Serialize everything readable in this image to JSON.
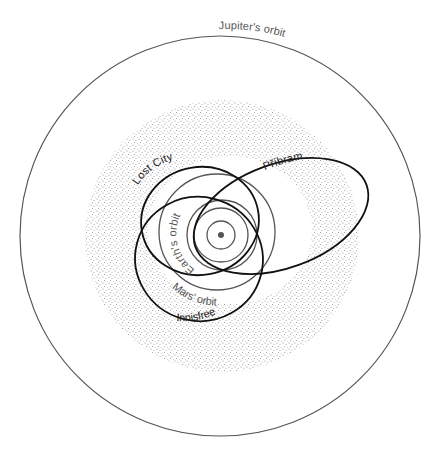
{
  "colors": {
    "background": "#ffffff",
    "planet_orbit": "#555555",
    "meteorite_orbit": "#111111",
    "asteroid_belt_stipple": "#9a9a9a",
    "sun": "#555555"
  },
  "labels": {
    "jupiter": "Jupiter's orbit",
    "earth": "Earth's orbit",
    "mars": "Mars' orbit",
    "lost_city": "Lost City",
    "pribram": "Příbram",
    "innisfree": "Innisfree"
  },
  "bodies": {
    "sun": {
      "cx": 221,
      "cy": 235,
      "r": 3
    },
    "planet_orbits": [
      {
        "name": "Mercury",
        "cx": 221,
        "cy": 235,
        "r": 14
      },
      {
        "name": "Venus",
        "cx": 221,
        "cy": 235,
        "r": 27
      },
      {
        "name": "Earth",
        "cx": 222,
        "cy": 235,
        "r": 35
      },
      {
        "name": "Mars",
        "cx": 217,
        "cy": 232,
        "r": 58
      },
      {
        "name": "Jupiter",
        "cx": 220,
        "cy": 236,
        "r": 200
      }
    ],
    "asteroid_belt": {
      "cx": 222,
      "cy": 236,
      "r_outer": 137,
      "r_inner": 80
    },
    "meteorite_orbits": [
      {
        "name": "Lost City",
        "cx": 200,
        "cy": 220,
        "rx": 60,
        "ry": 54,
        "rotate": -10
      },
      {
        "name": "Příbram",
        "cx": 281,
        "cy": 216,
        "rx": 91,
        "ry": 52,
        "rotate": -20
      },
      {
        "name": "Innisfree",
        "cx": 198,
        "cy": 260,
        "rx": 65,
        "ry": 62,
        "rotate": 15
      }
    ]
  }
}
